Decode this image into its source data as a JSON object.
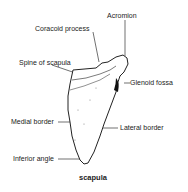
{
  "diagram": {
    "title": "scapula",
    "labels": {
      "acromion": "Acromion",
      "coracoid_process": "Coracoid process",
      "spine_of_scapula": "Spine of scapula",
      "glenoid_fossa": "Glenoid fossa",
      "medial_border": "Medial border",
      "lateral_border": "Lateral border",
      "inferior_angle": "Inferior angle"
    }
  }
}
